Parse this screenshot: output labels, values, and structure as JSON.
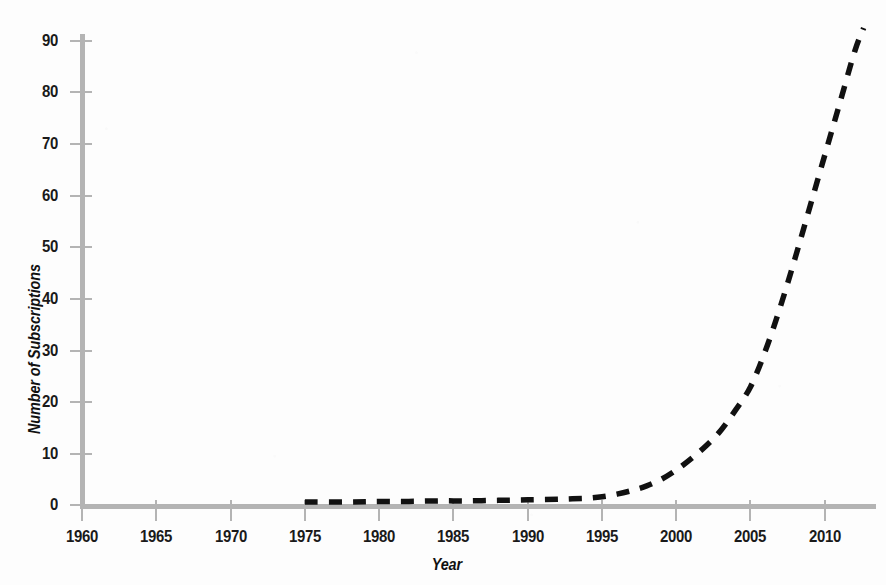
{
  "chart_data": {
    "type": "line",
    "title": "",
    "xlabel": "Year",
    "ylabel": "Number of Subscriptions",
    "xlim": [
      1960,
      2013
    ],
    "ylim": [
      0,
      90
    ],
    "xticks": [
      1960,
      1965,
      1970,
      1975,
      1980,
      1985,
      1990,
      1995,
      2000,
      2005,
      2010
    ],
    "yticks": [
      0,
      10,
      20,
      30,
      40,
      50,
      60,
      70,
      80,
      90
    ],
    "grid": false,
    "legend": false,
    "line_style": "dashed",
    "line_color": "#111111",
    "axis_color": "#b4b4b4",
    "series": [
      {
        "name": "Number of Subscriptions",
        "x": [
          1975,
          1978,
          1980,
          1982,
          1984,
          1986,
          1988,
          1990,
          1992,
          1993,
          1994,
          1995,
          1996,
          1997,
          1998,
          1999,
          2000,
          2001,
          2002,
          2003,
          2004,
          2005,
          2006,
          2007,
          2008,
          2009,
          2010,
          2011,
          2012,
          2012.6
        ],
        "values": [
          0.6,
          0.6,
          0.7,
          0.7,
          0.8,
          0.8,
          0.9,
          1.0,
          1.1,
          1.2,
          1.3,
          1.6,
          2.1,
          2.8,
          3.7,
          5.0,
          6.8,
          9.0,
          11.5,
          14.5,
          18.5,
          23.0,
          30.0,
          38.5,
          48.0,
          58.0,
          68.0,
          78.0,
          88.0,
          92.5
        ]
      }
    ]
  },
  "axis_labels": {
    "y": [
      "90",
      "80",
      "70",
      "60",
      "50",
      "40",
      "30",
      "20",
      "10",
      "0"
    ],
    "x": [
      "1960",
      "1965",
      "1970",
      "1975",
      "1980",
      "1985",
      "1990",
      "1995",
      "2000",
      "2005",
      "2010"
    ]
  },
  "titles": {
    "y_axis": "Number of Subscriptions",
    "x_axis": "Year"
  }
}
